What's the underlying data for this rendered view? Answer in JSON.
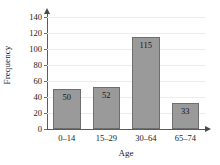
{
  "chart_data": {
    "type": "bar",
    "title": "",
    "subtitle": "",
    "categories": [
      "0–14",
      "15–29",
      "30–64",
      "65–74"
    ],
    "values": [
      50,
      52,
      115,
      33
    ],
    "data_labels": [
      "50",
      "52",
      "115",
      "33"
    ],
    "xlabel": "Age",
    "ylabel": "Frequency",
    "ylim": [
      0,
      140
    ],
    "yticks": [
      0,
      20,
      40,
      60,
      80,
      100,
      120,
      140
    ],
    "ytick_labels": [
      "0",
      "20",
      "40",
      "60",
      "80",
      "100",
      "120",
      "140"
    ],
    "grid": true,
    "grid_axis": "y",
    "legend": false,
    "legend_position": "none",
    "bar_color": "#9a9a9a",
    "bar_edge_color": "#6e6e6e",
    "gridline_color": "#ececec",
    "axis_color": "#5a5a5a",
    "text_color": "#1a1a1a",
    "background_color": "#ffffff",
    "y_axis_arrow": true,
    "x_axis_arrow": true
  }
}
